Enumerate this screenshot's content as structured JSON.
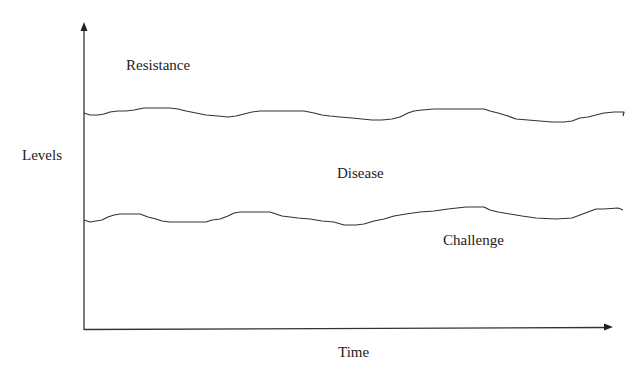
{
  "diagram": {
    "type": "conceptual-line-diagram",
    "x_axis_label": "Time",
    "y_axis_label": "Levels",
    "region_labels": {
      "above_upper_line": "Resistance",
      "between_lines": "Disease",
      "below_lower_line": "Challenge"
    },
    "lines": [
      {
        "name": "upper-threshold-line",
        "description": "Wavy horizontal line separating Resistance from Disease"
      },
      {
        "name": "lower-threshold-line",
        "description": "Wavy horizontal line separating Disease from Challenge"
      }
    ],
    "colors": {
      "line": "#333333",
      "text": "#222222",
      "background": "#ffffff"
    }
  }
}
